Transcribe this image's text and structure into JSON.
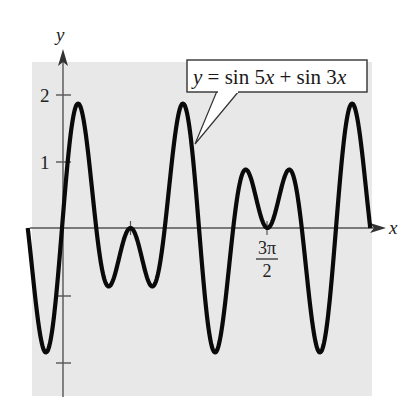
{
  "chart_data": {
    "type": "line",
    "title": "",
    "function": "y = sin 5x + sin 3x",
    "xlabel": "x",
    "ylabel": "y",
    "xlim": [
      -0.785398,
      7.068583
    ],
    "ylim": [
      -2.5,
      2.5
    ],
    "x_domain_label": "[-π/4, 9π/4]",
    "grid": false,
    "legend": "none",
    "x_ticks": [
      {
        "value": 1.570796,
        "label": ""
      },
      {
        "value": 4.712389,
        "label_num": "3π",
        "label_den": "2"
      }
    ],
    "y_ticks": [
      {
        "value": 2,
        "label": "2"
      },
      {
        "value": 1,
        "label": "1"
      },
      {
        "value": -1,
        "label": ""
      },
      {
        "value": -2,
        "label": ""
      }
    ],
    "series": [
      {
        "name": "y = sin 5x + sin 3x",
        "coef_a": 5,
        "coef_b": 3,
        "x": [
          -0.785,
          -0.393,
          0,
          0.262,
          0.393,
          0.785,
          1.178,
          1.571,
          1.963,
          2.356,
          2.749,
          3.142,
          3.534,
          3.927,
          4.32,
          4.712,
          5.105,
          5.498,
          5.89,
          6.283,
          6.545,
          6.676,
          7.069
        ],
        "values": [
          0,
          -1.307,
          0,
          1.673,
          1.848,
          0,
          -0.765,
          0,
          -0.765,
          0,
          1.848,
          0,
          -1.848,
          0,
          0.765,
          0,
          0.765,
          0,
          -1.848,
          0,
          1.673,
          1.307,
          0
        ]
      }
    ],
    "annotations": [
      {
        "text": "y = sin 5x + sin 3x",
        "type": "callout"
      }
    ],
    "colors": {
      "plot_background": "#e8e8e8",
      "curve": "#0a0a0a",
      "axes": "#555555",
      "callout_border": "#333333",
      "callout_fill": "#ffffff"
    }
  },
  "labels": {
    "y_axis": "y",
    "x_axis": "x",
    "tick_2": "2",
    "tick_1": "1",
    "tick_3pi_num": "3π",
    "tick_3pi_den": "2",
    "callout": {
      "y": "y",
      "eq": " = sin 5",
      "x1": "x",
      "plus": " + sin 3",
      "x2": "x"
    }
  }
}
